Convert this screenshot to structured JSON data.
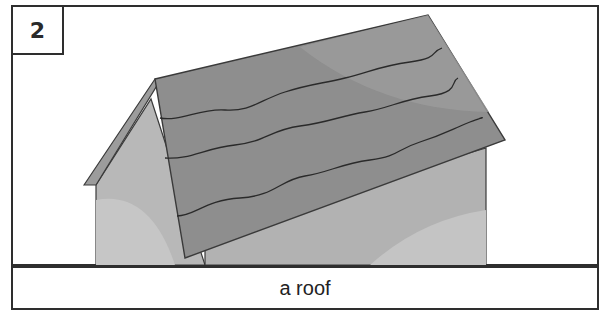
{
  "panel": {
    "number": "2",
    "caption": "a roof"
  },
  "illustration": {
    "subject": "house with shingled roof",
    "colors": {
      "roof": "#8c8c8c",
      "roof_light": "#9a9a9a",
      "wall": "#b4b4b4",
      "wall_light": "#c8c8c8",
      "outline": "#3a3a3a"
    }
  }
}
